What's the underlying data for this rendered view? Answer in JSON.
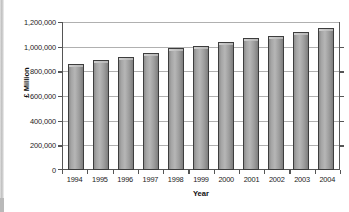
{
  "chart_data": {
    "type": "bar",
    "title": "",
    "xlabel": "Year",
    "ylabel": "£ Million",
    "categories": [
      "1994",
      "1995",
      "1996",
      "1997",
      "1998",
      "1999",
      "2000",
      "2001",
      "2002",
      "2003",
      "2004"
    ],
    "values": [
      870000,
      900000,
      925000,
      960000,
      995000,
      1015000,
      1050000,
      1080000,
      1100000,
      1130000,
      1160000
    ],
    "ylim": [
      0,
      1200000
    ],
    "ytick_labels": [
      "1,200,000",
      "1,000,000",
      "800,000",
      "600,000",
      "400,000",
      "200,000",
      "0"
    ],
    "ytick_values": [
      1200000,
      1000000,
      800000,
      600000,
      400000,
      200000,
      0
    ],
    "grid": true,
    "legend": "none",
    "series": [
      {
        "name": "£ Million",
        "values": [
          870000,
          900000,
          925000,
          960000,
          995000,
          1015000,
          1050000,
          1080000,
          1100000,
          1130000,
          1160000
        ]
      }
    ],
    "colors": {
      "bar_fill": "#aaaaaa",
      "bar_edge": "#3d3d3d",
      "gridline": "#b0b0b0",
      "axis": "#555555",
      "text": "#1b1b1b",
      "background": "#ffffff"
    }
  }
}
